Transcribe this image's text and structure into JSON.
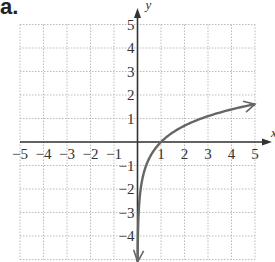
{
  "panel_label": "a.",
  "chart_data": {
    "type": "line",
    "title": "",
    "xlabel": "x",
    "ylabel": "y",
    "xlim": [
      -5,
      5
    ],
    "ylim": [
      -5,
      5
    ],
    "grid": true,
    "x_ticks": [
      -5,
      -4,
      -3,
      -2,
      -1,
      1,
      2,
      3,
      4,
      5
    ],
    "y_ticks": [
      5,
      4,
      3,
      2,
      1,
      -1,
      -2,
      -3,
      -4
    ],
    "series": [
      {
        "name": "y = ln(x) (approx.)",
        "x": [
          0.02,
          0.05,
          0.1,
          0.25,
          0.5,
          1,
          1.5,
          2,
          3,
          4,
          5
        ],
        "y": [
          -5,
          -4,
          -2.8,
          -1.6,
          -0.7,
          0,
          0.5,
          0.9,
          1.5,
          1.95,
          2.3
        ],
        "color": "#666666",
        "arrows": "both"
      }
    ]
  },
  "colors": {
    "axis": "#333333",
    "grid": "#bbbbbb",
    "curve": "#6a6a6a",
    "text": "#333333"
  }
}
